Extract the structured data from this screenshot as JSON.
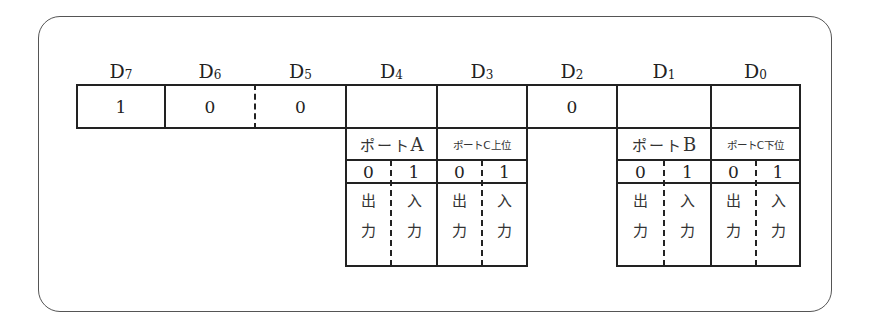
{
  "diagram": {
    "title": "",
    "bit_headers": [
      {
        "name": "D",
        "sub": "7"
      },
      {
        "name": "D",
        "sub": "6"
      },
      {
        "name": "D",
        "sub": "5"
      },
      {
        "name": "D",
        "sub": "4"
      },
      {
        "name": "D",
        "sub": "3"
      },
      {
        "name": "D",
        "sub": "2"
      },
      {
        "name": "D",
        "sub": "1"
      },
      {
        "name": "D",
        "sub": "0"
      }
    ],
    "bit_values": [
      "1",
      "0",
      "0",
      "",
      "",
      "0",
      "",
      ""
    ],
    "ports": [
      {
        "bit": "D4",
        "label": "ポート",
        "suffix": "A",
        "size": "big",
        "options": [
          {
            "value": "0",
            "meaning": [
              "出",
              "力"
            ]
          },
          {
            "value": "1",
            "meaning": [
              "入",
              "力"
            ]
          }
        ]
      },
      {
        "bit": "D3",
        "label": "ポートC上位",
        "suffix": "",
        "size": "small",
        "options": [
          {
            "value": "0",
            "meaning": [
              "出",
              "力"
            ]
          },
          {
            "value": "1",
            "meaning": [
              "入",
              "力"
            ]
          }
        ]
      },
      {
        "bit": "D1",
        "label": "ポート",
        "suffix": "B",
        "size": "big",
        "options": [
          {
            "value": "0",
            "meaning": [
              "出",
              "力"
            ]
          },
          {
            "value": "1",
            "meaning": [
              "入",
              "力"
            ]
          }
        ]
      },
      {
        "bit": "D0",
        "label": "ポートC下位",
        "suffix": "",
        "size": "small",
        "options": [
          {
            "value": "0",
            "meaning": [
              "出",
              "力"
            ]
          },
          {
            "value": "1",
            "meaning": [
              "入",
              "力"
            ]
          }
        ]
      }
    ],
    "colors": {
      "line": "#222222",
      "frame": "#555555",
      "background": "#ffffff"
    }
  }
}
